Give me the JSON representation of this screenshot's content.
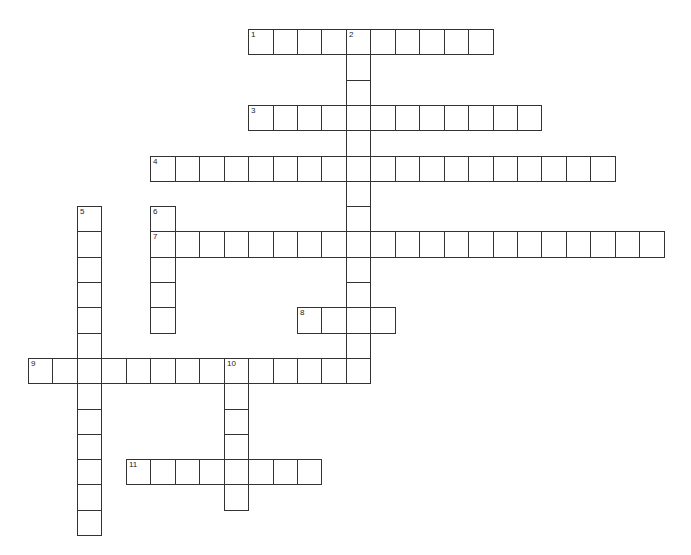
{
  "puzzle": {
    "origin_x": 28,
    "origin_y": 29,
    "cell_w": 24.45,
    "cell_h": 25.3,
    "line_color": "#333333",
    "entries": [
      {
        "number": "1",
        "direction": "across",
        "row": 0,
        "col": 9,
        "length": 10
      },
      {
        "number": "2",
        "direction": "down",
        "row": 0,
        "col": 13,
        "length": 14
      },
      {
        "number": "3",
        "direction": "across",
        "row": 3,
        "col": 9,
        "length": 12
      },
      {
        "number": "4",
        "direction": "across",
        "row": 5,
        "col": 5,
        "length": 19
      },
      {
        "number": "5",
        "direction": "down",
        "row": 7,
        "col": 2,
        "length": 13
      },
      {
        "number": "6",
        "direction": "down",
        "row": 7,
        "col": 5,
        "length": 5
      },
      {
        "number": "7",
        "direction": "across",
        "row": 8,
        "col": 5,
        "length": 21
      },
      {
        "number": "8",
        "direction": "across",
        "row": 11,
        "col": 11,
        "length": 4
      },
      {
        "number": "9",
        "direction": "across",
        "row": 13,
        "col": 0,
        "length": 14
      },
      {
        "number": "10",
        "direction": "down",
        "row": 13,
        "col": 8,
        "length": 6
      },
      {
        "number": "11",
        "direction": "across",
        "row": 17,
        "col": 4,
        "length": 8
      }
    ]
  }
}
